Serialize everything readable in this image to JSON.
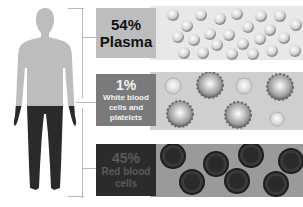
{
  "diagram": {
    "segments": [
      {
        "percent": "54%",
        "label": "Plasma",
        "box_color": "#bdbdbd",
        "text_color": "#111111",
        "strip_color": "#e8e8e8"
      },
      {
        "percent": "1%",
        "label": "White blood cells and platelets",
        "box_color": "#7a7a7a",
        "text_color": "#f2f2f2",
        "strip_color": "#cfcfcf"
      },
      {
        "percent": "45%",
        "label": "Red blood cells",
        "box_color": "#2b2b2b",
        "text_color": "#5a5a5a",
        "strip_color": "#9a9a9a"
      }
    ],
    "colors": {
      "body_upper": "#bdbdbd",
      "body_lower": "#2a2a2a",
      "bracket": "#b8b8b8"
    }
  }
}
